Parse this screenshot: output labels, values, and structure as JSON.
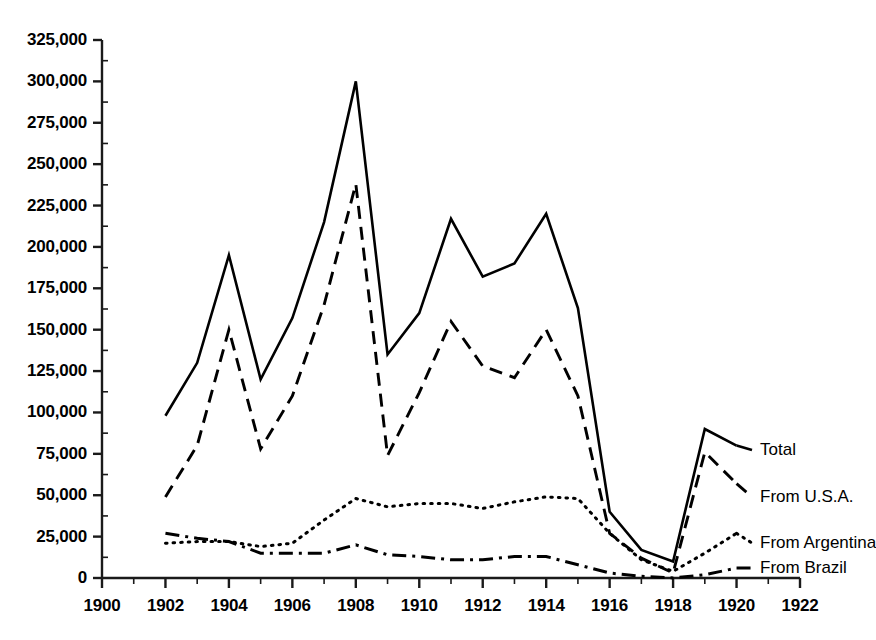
{
  "chart_data": {
    "type": "line",
    "title": "",
    "subtitle": "",
    "xlabel": "",
    "ylabel": "",
    "xlim": [
      1900,
      1922
    ],
    "ylim": [
      0,
      325000
    ],
    "grid": false,
    "legend_position": "right-inline-labels",
    "x": [
      1902,
      1903,
      1904,
      1905,
      1906,
      1907,
      1908,
      1909,
      1910,
      1911,
      1912,
      1913,
      1914,
      1915,
      1916,
      1917,
      1918,
      1919,
      1920
    ],
    "x_tick_labels": [
      "1900",
      "1902",
      "1904",
      "1906",
      "1908",
      "1910",
      "1912",
      "1914",
      "1916",
      "1918",
      "1920",
      "1922"
    ],
    "x_tick_values": [
      1900,
      1902,
      1904,
      1906,
      1908,
      1910,
      1912,
      1914,
      1916,
      1918,
      1920,
      1922
    ],
    "x_minor_tick_step": 1,
    "y_tick_labels": [
      "0",
      "25,000",
      "50,000",
      "75,000",
      "100,000",
      "125,000",
      "150,000",
      "175,000",
      "200,000",
      "225,000",
      "250,000",
      "275,000",
      "300,000",
      "325,000"
    ],
    "y_tick_values": [
      0,
      25000,
      50000,
      75000,
      100000,
      125000,
      150000,
      175000,
      200000,
      225000,
      250000,
      275000,
      300000,
      325000
    ],
    "y_minor_tick_step": 12500,
    "series": [
      {
        "name": "Total",
        "label": "Total",
        "style": "solid",
        "color": "#000000",
        "values": [
          98000,
          130000,
          195000,
          120000,
          157000,
          215000,
          300000,
          135000,
          160000,
          217000,
          182000,
          190000,
          220000,
          163000,
          40000,
          17000,
          10000,
          90000,
          80000
        ]
      },
      {
        "name": "From U.S.A.",
        "label": "From U.S.A.",
        "style": "dashed",
        "color": "#000000",
        "values": [
          49000,
          80000,
          150000,
          78000,
          110000,
          165000,
          238000,
          74000,
          112000,
          155000,
          128000,
          121000,
          150000,
          110000,
          27000,
          12000,
          3000,
          76000,
          57000
        ]
      },
      {
        "name": "From Argentina",
        "label": "From Argentina",
        "style": "dotted",
        "color": "#000000",
        "values": [
          21000,
          22000,
          22000,
          19000,
          21000,
          35000,
          48000,
          43000,
          45000,
          45000,
          42000,
          46000,
          49000,
          48000,
          27000,
          11000,
          4000,
          15000,
          27000
        ]
      },
      {
        "name": "From Brazil",
        "label": "From Brazil",
        "style": "dashdot",
        "color": "#000000",
        "values": [
          27000,
          24000,
          22000,
          15000,
          15000,
          15000,
          20000,
          14000,
          13000,
          11000,
          11000,
          13000,
          13000,
          8000,
          3000,
          1000,
          0,
          2000,
          6000
        ]
      }
    ]
  },
  "axis": {
    "axis_color": "#1a1a1a",
    "line_color": "#000000",
    "background": "#ffffff"
  },
  "legend_labels": {
    "total": "Total",
    "usa": "From U.S.A.",
    "argentina": "From Argentina",
    "brazil": "From Brazil"
  }
}
